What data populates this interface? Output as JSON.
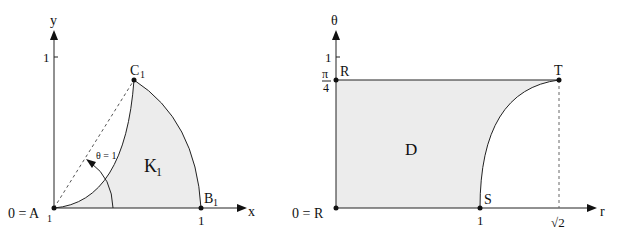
{
  "left": {
    "axis_x_label": "x",
    "axis_y_label": "y",
    "y_tick": "1",
    "x_tick": "1",
    "origin_label": "0 = A",
    "origin_sub": "1",
    "point_b": "B",
    "point_b_sub": "1",
    "point_c": "C",
    "point_c_sub": "1",
    "region_label": "K",
    "region_sub": "1",
    "angle_label": "θ = 1"
  },
  "right": {
    "axis_x_label": "r",
    "axis_y_label": "θ",
    "y_tick": "1",
    "pi_num": "π",
    "pi_den": "4",
    "origin_label": "0 = R",
    "point_r_top": "R",
    "point_t": "T",
    "point_s": "S",
    "x_tick_1": "1",
    "x_tick_sqrt2": "√2",
    "region_label": "D"
  },
  "colors": {
    "fill": "#ececec",
    "line": "#222222"
  }
}
